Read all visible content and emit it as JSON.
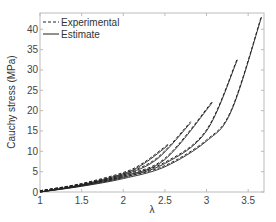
{
  "chart_data": {
    "type": "line",
    "title": "",
    "xlabel": "λ",
    "ylabel": "Cauchy stress (MPa)",
    "xlim": [
      1,
      3.69
    ],
    "ylim": [
      0,
      44
    ],
    "xticks": [
      1,
      1.5,
      2,
      2.5,
      3,
      3.5
    ],
    "xtick_labels": [
      "1",
      "1.5",
      "2",
      "2.5",
      "3",
      "3.5"
    ],
    "yticks": [
      0,
      5,
      10,
      15,
      20,
      25,
      30,
      35,
      40
    ],
    "ytick_labels": [
      "0",
      "5",
      "10",
      "15",
      "20",
      "25",
      "30",
      "35",
      "40"
    ],
    "grid": false,
    "legend": {
      "position": "upper left",
      "entries": [
        {
          "label": "Experimental",
          "style": "dashed"
        },
        {
          "label": "Estimate",
          "style": "solid"
        }
      ]
    },
    "series": [
      {
        "name": "Experimental 1",
        "style": "dashed",
        "x": [
          1,
          1.5,
          2,
          2.25,
          2.54
        ],
        "y": [
          0,
          1.8,
          4.5,
          7.0,
          11.5
        ]
      },
      {
        "name": "Estimate 1",
        "style": "solid",
        "x": [
          1,
          1.5,
          2,
          2.25,
          2.54
        ],
        "y": [
          0,
          1.8,
          4.5,
          7.0,
          11.5
        ]
      },
      {
        "name": "Experimental 2",
        "style": "dashed",
        "x": [
          1,
          1.5,
          2,
          2.4,
          2.81
        ],
        "y": [
          0,
          1.7,
          4.2,
          8.0,
          17.0
        ]
      },
      {
        "name": "Estimate 2",
        "style": "solid",
        "x": [
          1,
          1.5,
          2,
          2.4,
          2.81
        ],
        "y": [
          0,
          1.7,
          4.2,
          8.0,
          17.0
        ]
      },
      {
        "name": "Experimental 3",
        "style": "dashed",
        "x": [
          1,
          1.5,
          2,
          2.5,
          3.07
        ],
        "y": [
          0,
          1.6,
          3.9,
          8.0,
          22.0
        ]
      },
      {
        "name": "Estimate 3",
        "style": "solid",
        "x": [
          1,
          1.5,
          2,
          2.5,
          3.07
        ],
        "y": [
          0,
          1.6,
          3.9,
          8.0,
          22.0
        ]
      },
      {
        "name": "Experimental 4",
        "style": "dashed",
        "x": [
          1,
          1.5,
          2,
          2.5,
          3.0,
          3.37
        ],
        "y": [
          0,
          1.5,
          3.6,
          7.0,
          15.0,
          32.5
        ]
      },
      {
        "name": "Estimate 4",
        "style": "solid",
        "x": [
          1,
          1.5,
          2,
          2.5,
          3.0,
          3.37
        ],
        "y": [
          0,
          1.5,
          3.6,
          7.0,
          15.0,
          32.5
        ]
      },
      {
        "name": "Experimental 5",
        "style": "dashed",
        "x": [
          1,
          1.5,
          2,
          2.5,
          3.0,
          3.3,
          3.66
        ],
        "y": [
          0,
          1.4,
          3.3,
          6.2,
          12.5,
          20.0,
          43.0
        ]
      },
      {
        "name": "Estimate 5",
        "style": "solid",
        "x": [
          1,
          1.5,
          2,
          2.5,
          3.0,
          3.3,
          3.66
        ],
        "y": [
          0,
          1.4,
          3.3,
          6.2,
          12.5,
          20.0,
          43.0
        ]
      }
    ]
  },
  "colors": {
    "axis": "#bbbbbb",
    "curve": "#222222",
    "text": "#444444"
  }
}
